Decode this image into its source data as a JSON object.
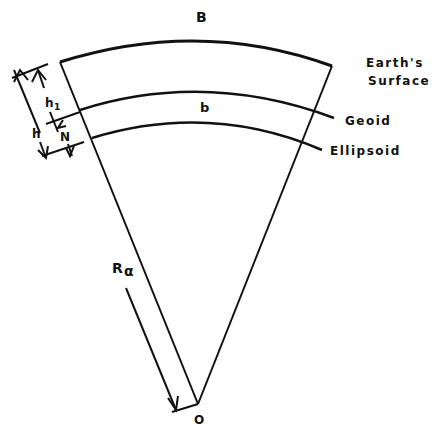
{
  "diagram": {
    "labels": {
      "arc_top": "B",
      "arc_mid": "b",
      "surface_line1": "Earth's",
      "surface_line2": "Surface",
      "geoid": "Geoid",
      "ellipsoid": "Ellipsoid",
      "h1_main": "h",
      "h1_sub": "1",
      "h": "h",
      "N": "N",
      "R_main": "R",
      "R_sub": "α",
      "origin": "O"
    },
    "colors": {
      "stroke": "#111111",
      "background": "#ffffff"
    }
  }
}
